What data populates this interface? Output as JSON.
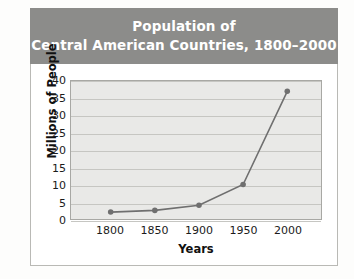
{
  "title": {
    "line1": "Population of",
    "line2": "Central American Countries, 1800–2000"
  },
  "colors": {
    "title_banner_background": "#8c8c8a",
    "title_text": "#ffffff",
    "plot_background": "#e9e9e7",
    "gridline": "#c6c6c2",
    "series_line": "#6f6f6f",
    "marker": "#6f6f6f",
    "card_background": "#ffffff",
    "card_border": "#b9b9b5",
    "axis_text": "#1b1b1b"
  },
  "chart_data": {
    "type": "line",
    "title": "Population of Central American Countries, 1800–2000",
    "xlabel": "Years",
    "ylabel": "Millions of People",
    "x": [
      1800,
      1850,
      1900,
      1950,
      2000
    ],
    "xtick_labels": [
      "1800",
      "1850",
      "1900",
      "1950",
      "2000"
    ],
    "values": [
      2,
      2.5,
      4,
      10,
      37
    ],
    "ylim": [
      0,
      40
    ],
    "yticks": [
      0,
      5,
      10,
      15,
      20,
      25,
      30,
      35,
      40
    ],
    "ytick_labels": [
      "0",
      "5",
      "10",
      "15",
      "20",
      "25",
      "30",
      "35",
      "40"
    ],
    "grid": true,
    "legend": false,
    "series": [
      {
        "name": "Population",
        "values": [
          2,
          2.5,
          4,
          10,
          37
        ]
      }
    ]
  }
}
